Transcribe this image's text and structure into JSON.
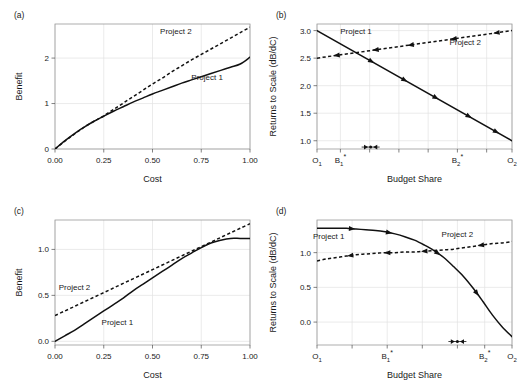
{
  "figure": {
    "panels": [
      "a",
      "b",
      "c",
      "d"
    ],
    "series_names": {
      "p1": "Project 1",
      "p2": "Project 2"
    }
  },
  "chart_data": [
    {
      "id": "a",
      "type": "line",
      "panel_label": "(a)",
      "title": "",
      "xlabel": "Cost",
      "ylabel": "Benefit",
      "xlim": [
        0.0,
        1.0
      ],
      "ylim": [
        0.0,
        2.75
      ],
      "xticks": [
        0.0,
        0.25,
        0.5,
        0.75,
        1.0
      ],
      "xticklabels": [
        "0.00",
        "0.25",
        "0.50",
        "0.75",
        "1.00"
      ],
      "yticks": [
        0,
        1,
        2
      ],
      "yticklabels": [
        "0",
        "1",
        "2"
      ],
      "grid": true,
      "legend": "inline-annotations",
      "series": [
        {
          "name": "Project 1",
          "style": "solid",
          "label_x": 0.78,
          "label_y": 1.52,
          "x": [
            0.0,
            0.05,
            0.1,
            0.15,
            0.2,
            0.25,
            0.3,
            0.35,
            0.4,
            0.45,
            0.5,
            0.55,
            0.6,
            0.65,
            0.7,
            0.75,
            0.8,
            0.85,
            0.9,
            0.95,
            1.0
          ],
          "y": [
            0.0,
            0.18,
            0.34,
            0.48,
            0.61,
            0.72,
            0.83,
            0.93,
            1.03,
            1.12,
            1.21,
            1.29,
            1.37,
            1.45,
            1.52,
            1.59,
            1.66,
            1.73,
            1.8,
            1.87,
            2.02
          ]
        },
        {
          "name": "Project 2",
          "style": "dashed",
          "label_x": 0.62,
          "label_y": 2.52,
          "x": [
            0.0,
            0.05,
            0.1,
            0.15,
            0.2,
            0.25,
            0.3,
            0.35,
            0.4,
            0.45,
            0.5,
            0.55,
            0.6,
            0.65,
            0.7,
            0.75,
            0.8,
            0.85,
            0.9,
            0.95,
            1.0
          ],
          "y": [
            0.0,
            0.17,
            0.33,
            0.48,
            0.61,
            0.73,
            0.87,
            1.01,
            1.15,
            1.29,
            1.43,
            1.56,
            1.7,
            1.83,
            1.96,
            2.08,
            2.2,
            2.32,
            2.44,
            2.56,
            2.68
          ]
        }
      ]
    },
    {
      "id": "b",
      "type": "line",
      "panel_label": "(b)",
      "title": "",
      "xlabel": "Budget Share",
      "ylabel": "Returns to Scale (dB/dC)",
      "xlim": [
        0.0,
        1.0
      ],
      "ylim": [
        0.85,
        3.12
      ],
      "xticks": [
        0.0,
        0.12,
        0.27,
        0.42,
        0.57,
        0.72,
        0.87,
        1.0
      ],
      "xticklabels": [
        "O₁",
        "B₁*",
        "",
        "",
        "",
        "B₂*",
        "",
        "O₂"
      ],
      "xtick_labeled": [
        0.0,
        0.12,
        0.72,
        1.0
      ],
      "yticks": [
        1.0,
        1.5,
        2.0,
        2.5,
        3.0
      ],
      "yticklabels": [
        "1.0",
        "1.5",
        "2.0",
        "2.5",
        "3.0"
      ],
      "grid": true,
      "equilibrium": {
        "x": 0.275,
        "y": 0.885,
        "marker": "converging-arrows"
      },
      "series": [
        {
          "name": "Project 1",
          "style": "solid",
          "arrow_direction": "right",
          "label_x": 0.2,
          "label_y": 2.94,
          "arrows_at": [
            0.28,
            0.45,
            0.61,
            0.78,
            0.92
          ],
          "x": [
            0.0,
            1.0
          ],
          "y": [
            3.0,
            1.0
          ]
        },
        {
          "name": "Project 2",
          "style": "dashed",
          "arrow_direction": "left",
          "label_x": 0.76,
          "label_y": 2.73,
          "arrows_at": [
            0.1,
            0.3,
            0.48,
            0.7,
            0.92
          ],
          "x": [
            0.0,
            1.0
          ],
          "y": [
            2.5,
            3.0
          ]
        }
      ]
    },
    {
      "id": "c",
      "type": "line",
      "panel_label": "(c)",
      "title": "",
      "xlabel": "Cost",
      "ylabel": "Benefit",
      "xlim": [
        0.0,
        1.0
      ],
      "ylim": [
        -0.04,
        1.32
      ],
      "xticks": [
        0.0,
        0.25,
        0.5,
        0.75,
        1.0
      ],
      "xticklabels": [
        "0.00",
        "0.25",
        "0.50",
        "0.75",
        "1.00"
      ],
      "yticks": [
        0.0,
        0.5,
        1.0
      ],
      "yticklabels": [
        "0.0",
        "0.5",
        "1.0"
      ],
      "grid": true,
      "series": [
        {
          "name": "Project 1",
          "style": "solid",
          "label_x": 0.32,
          "label_y": 0.18,
          "x": [
            0.0,
            0.05,
            0.1,
            0.15,
            0.2,
            0.25,
            0.3,
            0.35,
            0.4,
            0.45,
            0.5,
            0.55,
            0.6,
            0.65,
            0.7,
            0.75,
            0.8,
            0.85,
            0.9,
            0.95,
            1.0
          ],
          "y": [
            0.0,
            0.06,
            0.12,
            0.19,
            0.26,
            0.33,
            0.4,
            0.47,
            0.55,
            0.62,
            0.69,
            0.76,
            0.83,
            0.9,
            0.96,
            1.02,
            1.07,
            1.1,
            1.12,
            1.12,
            1.12
          ]
        },
        {
          "name": "Project 2",
          "style": "dashed",
          "label_x": 0.1,
          "label_y": 0.56,
          "x": [
            0.0,
            0.05,
            0.1,
            0.15,
            0.2,
            0.25,
            0.3,
            0.35,
            0.4,
            0.45,
            0.5,
            0.55,
            0.6,
            0.65,
            0.7,
            0.75,
            0.8,
            0.85,
            0.9,
            0.95,
            1.0
          ],
          "y": [
            0.28,
            0.33,
            0.38,
            0.43,
            0.48,
            0.53,
            0.58,
            0.63,
            0.68,
            0.73,
            0.78,
            0.83,
            0.88,
            0.93,
            0.98,
            1.03,
            1.08,
            1.13,
            1.18,
            1.23,
            1.28
          ]
        }
      ]
    },
    {
      "id": "d",
      "type": "line",
      "panel_label": "(d)",
      "title": "",
      "xlabel": "Budget Share",
      "ylabel": "Returns to Scale (dB/dC)",
      "xlim": [
        0.0,
        1.0
      ],
      "ylim": [
        -0.33,
        1.47
      ],
      "xticks": [
        0.0,
        0.18,
        0.36,
        0.54,
        0.72,
        0.86,
        1.0
      ],
      "xticklabels": [
        "O₁",
        "",
        "B₁*",
        "",
        "",
        "B₂*",
        "O₂"
      ],
      "xtick_labeled": [
        0.0,
        0.36,
        0.86,
        1.0
      ],
      "yticks": [
        0.0,
        0.5,
        1.0
      ],
      "yticklabels": [
        "0.0",
        "0.5",
        "1.0"
      ],
      "grid": true,
      "equilibrium": {
        "x": 0.72,
        "y": -0.28,
        "marker": "converging-arrows"
      },
      "series": [
        {
          "name": "Project 1",
          "style": "solid",
          "arrow_direction": "right",
          "label_x": 0.06,
          "label_y": 1.2,
          "arrows_at": [
            0.18,
            0.37,
            0.62,
            0.82
          ],
          "x": [
            0.0,
            0.05,
            0.1,
            0.15,
            0.2,
            0.25,
            0.3,
            0.35,
            0.4,
            0.45,
            0.5,
            0.55,
            0.6,
            0.65,
            0.7,
            0.75,
            0.8,
            0.85,
            0.9,
            0.95,
            1.0
          ],
          "y": [
            1.35,
            1.35,
            1.35,
            1.35,
            1.34,
            1.33,
            1.32,
            1.3,
            1.27,
            1.23,
            1.18,
            1.11,
            1.03,
            0.93,
            0.8,
            0.66,
            0.49,
            0.3,
            0.1,
            -0.07,
            -0.21
          ]
        },
        {
          "name": "Project 2",
          "style": "dashed",
          "arrow_direction": "left",
          "label_x": 0.72,
          "label_y": 1.23,
          "arrows_at": [
            0.17,
            0.36,
            0.55,
            0.84
          ],
          "x": [
            0.0,
            0.05,
            0.1,
            0.15,
            0.2,
            0.25,
            0.3,
            0.35,
            0.4,
            0.45,
            0.5,
            0.55,
            0.6,
            0.65,
            0.7,
            0.75,
            0.8,
            0.85,
            0.9,
            0.95,
            1.0
          ],
          "y": [
            0.88,
            0.91,
            0.93,
            0.95,
            0.97,
            0.98,
            0.99,
            1.0,
            1.0,
            1.01,
            1.01,
            1.02,
            1.03,
            1.04,
            1.05,
            1.07,
            1.09,
            1.11,
            1.13,
            1.14,
            1.16
          ]
        }
      ]
    }
  ]
}
